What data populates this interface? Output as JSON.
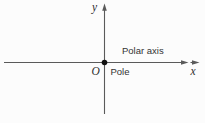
{
  "figure": {
    "name": "polar-coordinate-system-diagram",
    "labels": {
      "y_axis": "y",
      "x_axis": "x",
      "origin": "O",
      "pole": "Pole",
      "polar_axis": "Polar axis"
    },
    "colors": {
      "axis_line": "#5a5a5a",
      "text": "#333333",
      "origin_dot": "#111111",
      "background": "#fcfcfc"
    }
  }
}
